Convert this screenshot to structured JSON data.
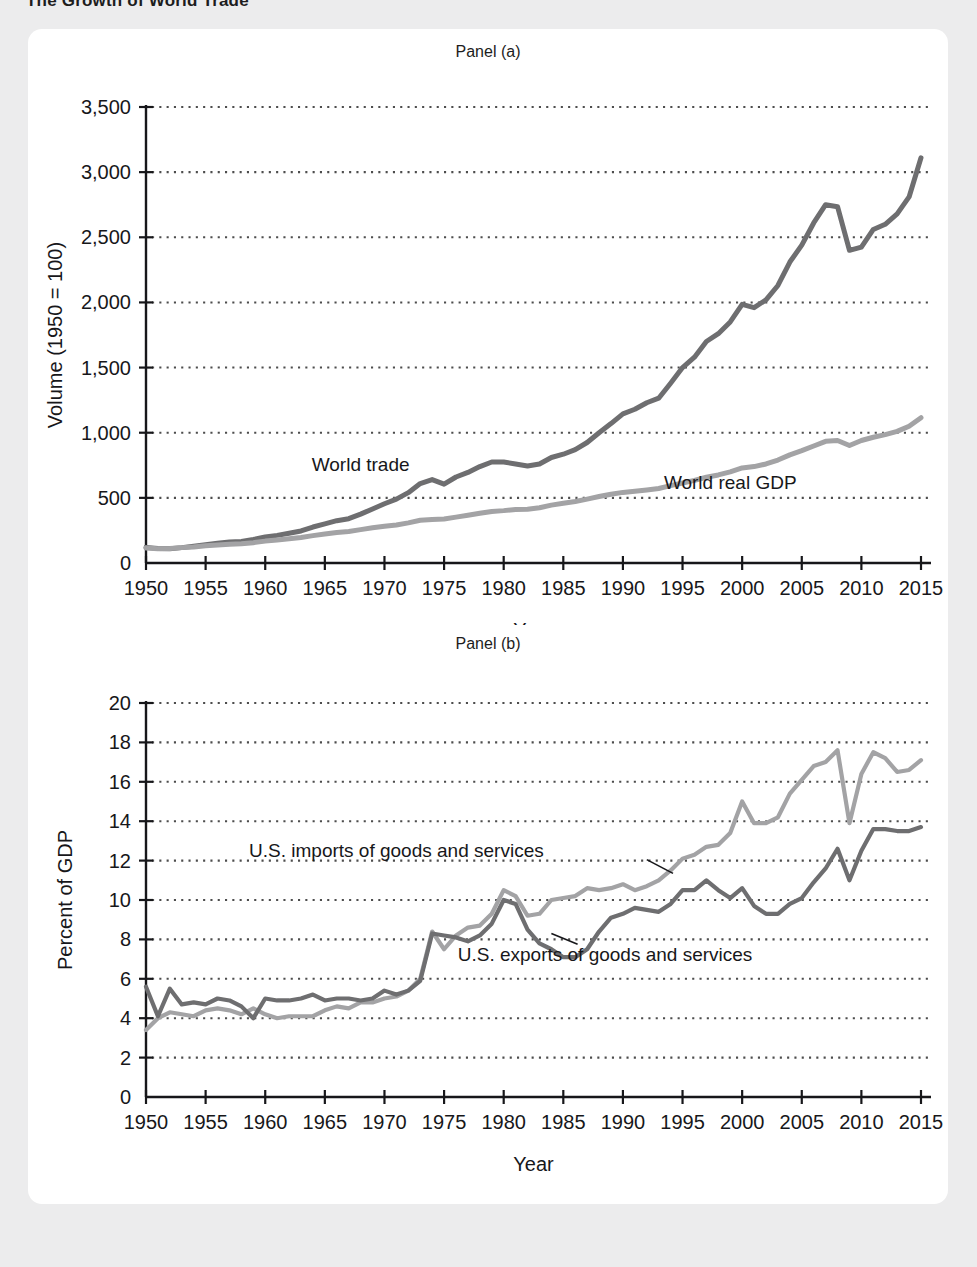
{
  "figure": {
    "title": "The Growth of World Trade",
    "background_color": "#ececed",
    "card_color": "#ffffff"
  },
  "colors": {
    "dark_series": "#6e6e70",
    "light_series": "#a3a3a5",
    "axis": "#17171a",
    "grid": "#4d4d4d",
    "text": "#17171a"
  },
  "chart_data": [
    {
      "type": "line",
      "panel": "Panel (a)",
      "title": "Panel (a)",
      "xlabel": "Year",
      "ylabel": "Volume (1950 = 100)",
      "xlim": [
        1950,
        2015
      ],
      "ylim": [
        0,
        3500
      ],
      "xticks": [
        1950,
        1955,
        1960,
        1965,
        1970,
        1975,
        1980,
        1985,
        1990,
        1995,
        2000,
        2005,
        2010,
        2015
      ],
      "yticks": [
        0,
        500,
        1000,
        1500,
        2000,
        2500,
        3000,
        3500
      ],
      "ytick_labels": [
        "0",
        "500",
        "1,000",
        "1,500",
        "2,000",
        "2,500",
        "3,000",
        "3,500"
      ],
      "grid": "horizontal-dotted",
      "legend": "inline-labels",
      "series": [
        {
          "name": "World trade",
          "color": "#6e6e70",
          "label_x": 1968,
          "label_y": 760,
          "x": [
            1950,
            1951,
            1952,
            1953,
            1954,
            1955,
            1956,
            1957,
            1958,
            1959,
            1960,
            1961,
            1962,
            1963,
            1964,
            1965,
            1966,
            1967,
            1968,
            1969,
            1970,
            1971,
            1972,
            1973,
            1974,
            1975,
            1976,
            1977,
            1978,
            1979,
            1980,
            1981,
            1982,
            1983,
            1984,
            1985,
            1986,
            1987,
            1988,
            1989,
            1990,
            1991,
            1992,
            1993,
            1994,
            1995,
            1996,
            1997,
            1998,
            1999,
            2000,
            2001,
            2002,
            2003,
            2004,
            2005,
            2006,
            2007,
            2008,
            2009,
            2010,
            2011,
            2012,
            2013,
            2014,
            2015
          ],
          "values": [
            120,
            112,
            110,
            118,
            128,
            140,
            152,
            162,
            165,
            180,
            200,
            212,
            228,
            246,
            276,
            300,
            325,
            340,
            375,
            415,
            455,
            490,
            540,
            610,
            640,
            605,
            660,
            695,
            740,
            775,
            775,
            760,
            745,
            760,
            810,
            835,
            870,
            925,
            1000,
            1070,
            1145,
            1180,
            1230,
            1265,
            1380,
            1500,
            1580,
            1700,
            1760,
            1850,
            1985,
            1960,
            2020,
            2130,
            2310,
            2440,
            2610,
            2750,
            2735,
            2400,
            2425,
            2560,
            2600,
            2680,
            2810,
            3110
          ]
        },
        {
          "name": "World real GDP",
          "color": "#a3a3a5",
          "label_x": 1999,
          "label_y": 620,
          "x": [
            1950,
            1951,
            1952,
            1953,
            1954,
            1955,
            1956,
            1957,
            1958,
            1959,
            1960,
            1961,
            1962,
            1963,
            1964,
            1965,
            1966,
            1967,
            1968,
            1969,
            1970,
            1971,
            1972,
            1973,
            1974,
            1975,
            1976,
            1977,
            1978,
            1979,
            1980,
            1981,
            1982,
            1983,
            1984,
            1985,
            1986,
            1987,
            1988,
            1989,
            1990,
            1991,
            1992,
            1993,
            1994,
            1995,
            1996,
            1997,
            1998,
            1999,
            2000,
            2001,
            2002,
            2003,
            2004,
            2005,
            2006,
            2007,
            2008,
            2009,
            2010,
            2011,
            2012,
            2013,
            2014,
            2015
          ],
          "values": [
            115,
            110,
            112,
            118,
            122,
            132,
            138,
            144,
            148,
            156,
            168,
            176,
            186,
            196,
            210,
            222,
            234,
            242,
            256,
            270,
            282,
            292,
            308,
            328,
            334,
            338,
            352,
            366,
            382,
            396,
            402,
            410,
            412,
            424,
            444,
            458,
            472,
            490,
            510,
            528,
            542,
            550,
            560,
            572,
            594,
            614,
            634,
            658,
            676,
            700,
            730,
            740,
            760,
            790,
            830,
            862,
            898,
            934,
            940,
            902,
            940,
            965,
            985,
            1010,
            1050,
            1115
          ]
        }
      ]
    },
    {
      "type": "line",
      "panel": "Panel (b)",
      "title": "Panel (b)",
      "xlabel": "Year",
      "ylabel": "Percent of GDP",
      "xlim": [
        1950,
        2015
      ],
      "ylim": [
        0,
        20
      ],
      "xticks": [
        1950,
        1955,
        1960,
        1965,
        1970,
        1975,
        1980,
        1985,
        1990,
        1995,
        2000,
        2005,
        2010,
        2015
      ],
      "yticks": [
        0,
        2,
        4,
        6,
        8,
        10,
        12,
        14,
        16,
        18,
        20
      ],
      "ytick_labels": [
        "0",
        "2",
        "4",
        "6",
        "8",
        "10",
        "12",
        "14",
        "16",
        "18",
        "20"
      ],
      "grid": "horizontal-dotted",
      "legend": "inline-labels-with-leader",
      "series": [
        {
          "name": "U.S. imports of goods and services",
          "color": "#a3a3a5",
          "label_x": 1971,
          "label_y": 12.55,
          "leader_from": [
            1992.0,
            12.05
          ],
          "leader_to": [
            1994.2,
            11.35
          ],
          "x": [
            1950,
            1951,
            1952,
            1953,
            1954,
            1955,
            1956,
            1957,
            1958,
            1959,
            1960,
            1961,
            1962,
            1963,
            1964,
            1965,
            1966,
            1967,
            1968,
            1969,
            1970,
            1971,
            1972,
            1973,
            1974,
            1975,
            1976,
            1977,
            1978,
            1979,
            1980,
            1981,
            1982,
            1983,
            1984,
            1985,
            1986,
            1987,
            1988,
            1989,
            1990,
            1991,
            1992,
            1993,
            1994,
            1995,
            1996,
            1997,
            1998,
            1999,
            2000,
            2001,
            2002,
            2003,
            2004,
            2005,
            2006,
            2007,
            2008,
            2009,
            2010,
            2011,
            2012,
            2013,
            2014,
            2015
          ],
          "values": [
            3.4,
            4.0,
            4.3,
            4.2,
            4.1,
            4.4,
            4.5,
            4.4,
            4.2,
            4.5,
            4.2,
            4.0,
            4.1,
            4.1,
            4.1,
            4.4,
            4.6,
            4.5,
            4.8,
            4.8,
            5.0,
            5.1,
            5.4,
            6.0,
            8.4,
            7.5,
            8.2,
            8.6,
            8.7,
            9.3,
            10.5,
            10.2,
            9.2,
            9.3,
            10.0,
            10.1,
            10.2,
            10.6,
            10.5,
            10.6,
            10.8,
            10.5,
            10.7,
            11.0,
            11.5,
            12.1,
            12.3,
            12.7,
            12.8,
            13.4,
            15.0,
            13.9,
            13.9,
            14.2,
            15.4,
            16.1,
            16.8,
            17.0,
            17.6,
            13.9,
            16.4,
            17.5,
            17.2,
            16.5,
            16.6,
            17.1
          ]
        },
        {
          "name": "U.S. exports of goods and services",
          "color": "#6e6e70",
          "label_x": 1988.5,
          "label_y": 7.25,
          "leader_from": [
            1984.0,
            8.3
          ],
          "leader_to": [
            1986.2,
            7.75
          ],
          "x": [
            1950,
            1951,
            1952,
            1953,
            1954,
            1955,
            1956,
            1957,
            1958,
            1959,
            1960,
            1961,
            1962,
            1963,
            1964,
            1965,
            1966,
            1967,
            1968,
            1969,
            1970,
            1971,
            1972,
            1973,
            1974,
            1975,
            1976,
            1977,
            1978,
            1979,
            1980,
            1981,
            1982,
            1983,
            1984,
            1985,
            1986,
            1987,
            1988,
            1989,
            1990,
            1991,
            1992,
            1993,
            1994,
            1995,
            1996,
            1997,
            1998,
            1999,
            2000,
            2001,
            2002,
            2003,
            2004,
            2005,
            2006,
            2007,
            2008,
            2009,
            2010,
            2011,
            2012,
            2013,
            2014,
            2015
          ],
          "values": [
            5.6,
            4.1,
            5.5,
            4.7,
            4.8,
            4.7,
            5.0,
            4.9,
            4.6,
            4.0,
            5.0,
            4.9,
            4.9,
            5.0,
            5.2,
            4.9,
            5.0,
            5.0,
            4.9,
            5.0,
            5.4,
            5.2,
            5.4,
            5.9,
            8.3,
            8.2,
            8.1,
            7.9,
            8.2,
            8.8,
            10.0,
            9.8,
            8.5,
            7.8,
            7.5,
            7.1,
            7.1,
            7.5,
            8.4,
            9.1,
            9.3,
            9.6,
            9.5,
            9.4,
            9.8,
            10.5,
            10.5,
            11.0,
            10.5,
            10.1,
            10.6,
            9.7,
            9.3,
            9.3,
            9.8,
            10.1,
            10.9,
            11.6,
            12.6,
            11.0,
            12.5,
            13.6,
            13.6,
            13.5,
            13.5,
            13.7
          ]
        }
      ]
    }
  ]
}
